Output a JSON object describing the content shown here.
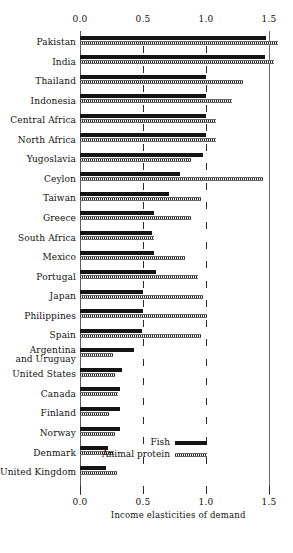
{
  "chart_data": {
    "type": "bar",
    "orientation": "horizontal",
    "title": "",
    "xlabel": "Income elasticities of demand",
    "ylabel": "",
    "xlim": [
      0.0,
      1.6
    ],
    "xticks": [
      0.0,
      0.5,
      1.0,
      1.5
    ],
    "xtick_labels": [
      "0.0",
      "0.5",
      "1.0",
      "1.5"
    ],
    "grid": true,
    "legend_position": "inside-right-lower",
    "categories": [
      "Pakistan",
      "India",
      "Thailand",
      "Indonesia",
      "Central Africa",
      "North Africa",
      "Yugoslavia",
      "Ceylon",
      "Taiwan",
      "Greece",
      "South Africa",
      "Mexico",
      "Portugal",
      "Japan",
      "Philippines",
      "Spain",
      "Argentina\nand Uruguay",
      "United States",
      "Canada",
      "Finland",
      "Norway",
      "Denmark",
      "United Kingdom"
    ],
    "series": [
      {
        "name": "Fish",
        "style": "solid-black",
        "values": [
          1.48,
          1.47,
          1.0,
          1.0,
          1.0,
          1.0,
          0.98,
          0.79,
          0.71,
          0.59,
          0.57,
          0.59,
          0.6,
          0.5,
          0.5,
          0.49,
          0.43,
          0.33,
          0.32,
          0.32,
          0.32,
          0.22,
          0.21
        ]
      },
      {
        "name": "Animal protein",
        "style": "hatched",
        "values": [
          1.57,
          1.54,
          1.29,
          1.21,
          1.08,
          1.08,
          0.88,
          1.45,
          0.96,
          0.88,
          0.59,
          0.83,
          0.94,
          0.98,
          1.01,
          0.96,
          0.26,
          0.28,
          0.3,
          0.23,
          0.28,
          0.27,
          0.29
        ]
      }
    ]
  },
  "legend": {
    "fish_label": "Fish",
    "protein_label": "Animal protein"
  },
  "axis": {
    "tick_0": "0.0",
    "tick_1": "0.5",
    "tick_2": "1.0",
    "tick_3": "1.5",
    "caption": "Income elasticities of demand"
  }
}
